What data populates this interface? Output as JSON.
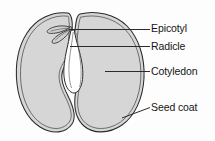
{
  "figure": {
    "subject": "seed",
    "background_color": "#fdfdfd",
    "line_color": "#2b2b2b",
    "fill_color": "#d6d6d6",
    "embryo_fill_color": "#ffffff",
    "text_color": "#161616"
  },
  "labels": [
    {
      "id": "epicotyl",
      "text": "Epicotyl",
      "leader": "horizontal",
      "points_to": "plumule at top of embryo axis"
    },
    {
      "id": "radicle",
      "text": "Radicle",
      "leader": "horizontal",
      "points_to": "embryonic root between cotyledons"
    },
    {
      "id": "cotyledon",
      "text": "Cotyledon",
      "leader": "horizontal",
      "points_to": "right seed leaf"
    },
    {
      "id": "seedcoat",
      "text": "Seed coat",
      "leader": "diagonal",
      "points_to": "outer double-line coat of right half"
    }
  ],
  "parts": [
    {
      "id": "left-cotyledon",
      "name": "Left cotyledon half"
    },
    {
      "id": "right-cotyledon",
      "name": "Right cotyledon half"
    },
    {
      "id": "left-seed-coat",
      "name": "Left seed coat"
    },
    {
      "id": "right-seed-coat",
      "name": "Right seed coat"
    },
    {
      "id": "radicle-body",
      "name": "Radicle"
    },
    {
      "id": "epicotyl-body",
      "name": "Epicotyl / plumule"
    }
  ]
}
